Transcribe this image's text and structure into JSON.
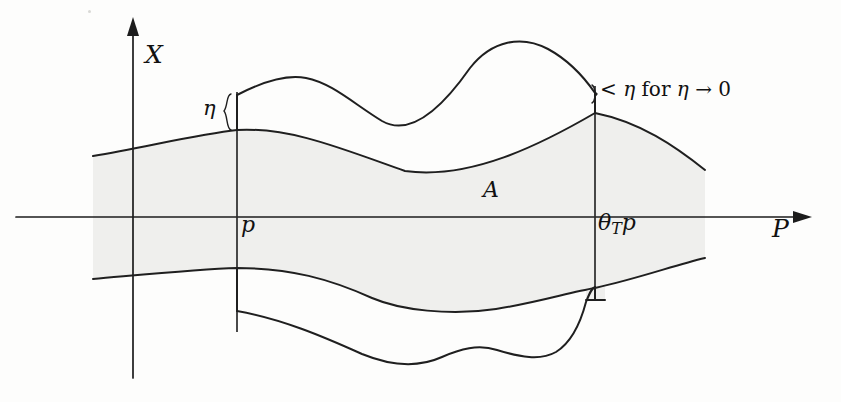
{
  "figure": {
    "type": "mathematical-diagram",
    "background_color": "#fdfdfc",
    "ink_color": "#1f1f1f",
    "shade_color": "#efefed",
    "axes": {
      "vertical": {
        "label": "X",
        "name": "x-axis",
        "x_px": 133,
        "top_px": 24,
        "bottom_px": 378,
        "arrow": "up"
      },
      "horizontal": {
        "label": "P",
        "name": "p-axis",
        "y_px": 217,
        "left_px": 16,
        "right_px": 805,
        "arrow": "right"
      }
    },
    "vertical_markers": [
      {
        "name": "p-line",
        "label": "p",
        "x_px": 237,
        "top_px": 92,
        "bottom_px": 330
      },
      {
        "name": "theta-t-p-line",
        "label": "θ",
        "label_sub": "T",
        "label_tail": "p",
        "x_px": 595,
        "top_px": 88,
        "bottom_px": 300
      }
    ],
    "labels": {
      "x_axis": "X",
      "p_axis": "P",
      "p_marker": "p",
      "theta_marker_base": "θ",
      "theta_marker_sub": "T",
      "theta_marker_tail": "p",
      "region": "A",
      "eta": "η",
      "eta_condition_lt": "<",
      "eta_condition_eta1": "η",
      "eta_condition_for": "for",
      "eta_condition_eta2": "η",
      "eta_condition_arrow": "→",
      "eta_condition_zero": "0",
      "eta_condition_full": "< η for η → 0"
    },
    "braces": [
      {
        "name": "eta-brace",
        "x_px": 228,
        "top_px": 93,
        "bottom_px": 132
      },
      {
        "name": "eta-condition-brace",
        "x_px": 591,
        "top_px": 84,
        "bottom_px": 104
      }
    ],
    "curves": {
      "shaded_upper": "M 93 156 C 150 146 200 134 237 130 C 290 127 340 148 405 171 C 470 180 540 145 595 113 C 640 122 675 146 705 170",
      "shaded_lower": "M 93 279 C 150 274 200 269 237 268 C 290 268 330 279 372 298 C 440 320 500 314 540 302 C 570 292 595 288 595 288 C 640 278 675 265 705 258",
      "outer_upper": "M 237 95 C 270 82 288 77 305 78 C 330 80 352 100 380 120 C 410 136 440 112 470 70 C 490 43 520 37 545 48 C 570 58 583 76 595 93",
      "outer_lower": "M 237 310 C 280 318 320 334 360 352 C 395 366 420 366 440 358 C 460 350 478 345 496 350 C 520 357 540 362 556 353 C 572 343 580 322 585 304 C 589 293 592 288 595 287",
      "shade_region": "M 93 156 C 150 146 200 134 237 130 C 290 127 340 148 405 171 C 470 180 540 145 595 113 C 640 122 675 146 705 170 L 705 258 C 675 265 640 278 595 288 C 570 292 540 302 496 309 C 450 316 400 310 372 298 C 330 279 290 268 237 268 C 200 269 150 274 93 279 Z"
    }
  }
}
